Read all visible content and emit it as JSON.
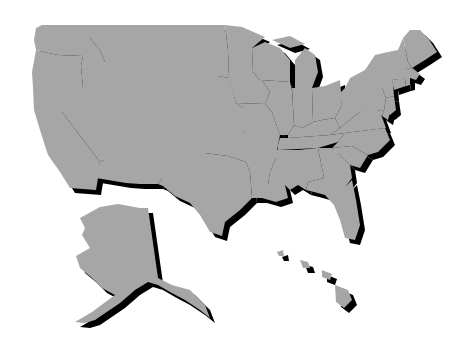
{
  "map": {
    "title": "",
    "subject": "United States of America - states outline",
    "colors": {
      "background": "#ffffff",
      "land": "#a6a6a6",
      "border": "#f2f2f2",
      "shadow": "#000000"
    },
    "shadow_offset": {
      "dx": 5,
      "dy": 5
    },
    "regions": [
      {
        "id": "WA",
        "name": "Washington"
      },
      {
        "id": "OR",
        "name": "Oregon"
      },
      {
        "id": "CA",
        "name": "California"
      },
      {
        "id": "NV",
        "name": "Nevada"
      },
      {
        "id": "ID",
        "name": "Idaho"
      },
      {
        "id": "MT",
        "name": "Montana"
      },
      {
        "id": "WY",
        "name": "Wyoming"
      },
      {
        "id": "UT",
        "name": "Utah"
      },
      {
        "id": "CO",
        "name": "Colorado"
      },
      {
        "id": "AZ",
        "name": "Arizona"
      },
      {
        "id": "NM",
        "name": "New Mexico"
      },
      {
        "id": "ND",
        "name": "North Dakota"
      },
      {
        "id": "SD",
        "name": "South Dakota"
      },
      {
        "id": "NE",
        "name": "Nebraska"
      },
      {
        "id": "KS",
        "name": "Kansas"
      },
      {
        "id": "OK",
        "name": "Oklahoma"
      },
      {
        "id": "TX",
        "name": "Texas"
      },
      {
        "id": "MN",
        "name": "Minnesota"
      },
      {
        "id": "IA",
        "name": "Iowa"
      },
      {
        "id": "MO",
        "name": "Missouri"
      },
      {
        "id": "AR",
        "name": "Arkansas"
      },
      {
        "id": "LA",
        "name": "Louisiana"
      },
      {
        "id": "WI",
        "name": "Wisconsin"
      },
      {
        "id": "IL",
        "name": "Illinois"
      },
      {
        "id": "MI",
        "name": "Michigan"
      },
      {
        "id": "IN",
        "name": "Indiana"
      },
      {
        "id": "OH",
        "name": "Ohio"
      },
      {
        "id": "KY",
        "name": "Kentucky"
      },
      {
        "id": "TN",
        "name": "Tennessee"
      },
      {
        "id": "MS",
        "name": "Mississippi"
      },
      {
        "id": "AL",
        "name": "Alabama"
      },
      {
        "id": "GA",
        "name": "Georgia"
      },
      {
        "id": "FL",
        "name": "Florida"
      },
      {
        "id": "SC",
        "name": "South Carolina"
      },
      {
        "id": "NC",
        "name": "North Carolina"
      },
      {
        "id": "VA",
        "name": "Virginia"
      },
      {
        "id": "WV",
        "name": "West Virginia"
      },
      {
        "id": "PA",
        "name": "Pennsylvania"
      },
      {
        "id": "NY",
        "name": "New York"
      },
      {
        "id": "NJ",
        "name": "New Jersey"
      },
      {
        "id": "MD",
        "name": "Maryland"
      },
      {
        "id": "DE",
        "name": "Delaware"
      },
      {
        "id": "CT",
        "name": "Connecticut"
      },
      {
        "id": "RI",
        "name": "Rhode Island"
      },
      {
        "id": "MA",
        "name": "Massachusetts"
      },
      {
        "id": "VT",
        "name": "Vermont"
      },
      {
        "id": "NH",
        "name": "New Hampshire"
      },
      {
        "id": "ME",
        "name": "Maine"
      },
      {
        "id": "AK",
        "name": "Alaska"
      },
      {
        "id": "HI",
        "name": "Hawaii"
      }
    ]
  }
}
